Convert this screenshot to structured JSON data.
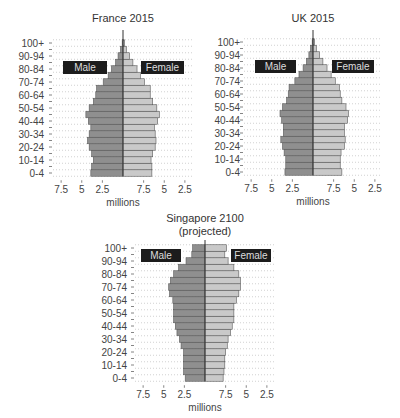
{
  "chart_data": [
    {
      "type": "bar",
      "subtype": "population-pyramid",
      "title": "France 2015",
      "xlabel": "millions",
      "ylabel": "",
      "x_tick_labels_left": [
        "7.5",
        "5",
        "2.5"
      ],
      "x_tick_labels_right": [
        "7.5",
        "5",
        "2.5"
      ],
      "xlim": [
        -7.5,
        7.5
      ],
      "y_tick_labels": [
        "100+",
        "90-94",
        "80-84",
        "70-74",
        "60-64",
        "50-54",
        "40-44",
        "30-34",
        "20-24",
        "10-14",
        "0-4"
      ],
      "legend": [
        "Male",
        "Female"
      ],
      "grid": "dotted horizontal",
      "categories": [
        "0-4",
        "5-9",
        "10-14",
        "15-19",
        "20-24",
        "25-29",
        "30-34",
        "35-39",
        "40-44",
        "45-49",
        "50-54",
        "55-59",
        "60-64",
        "65-69",
        "70-74",
        "75-79",
        "80-84",
        "85-89",
        "90-94",
        "95-99",
        "100+"
      ],
      "series": [
        {
          "name": "Male",
          "values": [
            3.9,
            3.8,
            3.6,
            3.8,
            4.1,
            4.3,
            4.1,
            3.9,
            4.2,
            4.5,
            4.1,
            3.6,
            3.3,
            3.2,
            2.4,
            1.8,
            1.4,
            0.9,
            0.6,
            0.3,
            0.1
          ]
        },
        {
          "name": "Female",
          "values": [
            3.5,
            3.5,
            3.4,
            3.6,
            3.9,
            4.0,
            3.9,
            3.8,
            4.2,
            4.4,
            4.1,
            3.6,
            3.3,
            3.3,
            2.6,
            2.1,
            1.7,
            1.2,
            0.8,
            0.4,
            0.2
          ]
        }
      ]
    },
    {
      "type": "bar",
      "subtype": "population-pyramid",
      "title": "UK 2015",
      "xlabel": "millions",
      "ylabel": "",
      "x_tick_labels_left": [
        "7.5",
        "5",
        "2.5"
      ],
      "x_tick_labels_right": [
        "7.5",
        "5",
        "2.5"
      ],
      "xlim": [
        -7.5,
        7.5
      ],
      "y_tick_labels": [
        "100+",
        "90-94",
        "80-84",
        "70-74",
        "60-64",
        "50-54",
        "40-44",
        "30-34",
        "20-24",
        "10-14",
        "0-4"
      ],
      "legend": [
        "Male",
        "Female"
      ],
      "grid": "dotted horizontal",
      "categories": [
        "0-4",
        "5-9",
        "10-14",
        "15-19",
        "20-24",
        "25-29",
        "30-34",
        "35-39",
        "40-44",
        "45-49",
        "50-54",
        "55-59",
        "60-64",
        "65-69",
        "70-74",
        "75-79",
        "80-84",
        "85-89",
        "90-94",
        "95-99",
        "100+"
      ],
      "series": [
        {
          "name": "Male",
          "values": [
            3.4,
            3.3,
            3.3,
            3.5,
            3.7,
            3.9,
            3.6,
            3.6,
            3.8,
            4.0,
            3.7,
            3.2,
            3.0,
            2.9,
            2.2,
            1.7,
            1.2,
            0.8,
            0.5,
            0.3,
            0.1
          ]
        },
        {
          "name": "Female",
          "values": [
            3.5,
            3.3,
            3.3,
            3.4,
            3.8,
            3.9,
            3.8,
            3.8,
            4.2,
            4.3,
            4.0,
            3.5,
            3.3,
            3.2,
            2.7,
            2.2,
            1.7,
            1.2,
            0.8,
            0.4,
            0.2
          ]
        }
      ]
    },
    {
      "type": "bar",
      "subtype": "population-pyramid",
      "title": "Singapore 2100",
      "subtitle": "(projected)",
      "xlabel": "millions",
      "ylabel": "",
      "x_tick_labels_left": [
        "7.5",
        "5",
        "2.5"
      ],
      "x_tick_labels_right": [
        "7.5",
        "5",
        "2.5"
      ],
      "xlim": [
        -7.5,
        7.5
      ],
      "y_tick_labels": [
        "100+",
        "90-94",
        "80-84",
        "70-74",
        "60-64",
        "50-54",
        "40-44",
        "30-34",
        "20-24",
        "10-14",
        "0-4"
      ],
      "legend": [
        "Male",
        "Female"
      ],
      "grid": "dotted horizontal",
      "categories": [
        "0-4",
        "5-9",
        "10-14",
        "15-19",
        "20-24",
        "25-29",
        "30-34",
        "35-39",
        "40-44",
        "45-49",
        "50-54",
        "55-59",
        "60-64",
        "65-69",
        "70-74",
        "75-79",
        "80-84",
        "85-89",
        "90-94",
        "95-99",
        "100+"
      ],
      "series": [
        {
          "name": "Male",
          "values": [
            2.4,
            2.6,
            2.6,
            2.6,
            2.6,
            2.9,
            3.1,
            3.4,
            3.6,
            3.8,
            3.8,
            3.8,
            3.9,
            4.3,
            4.4,
            4.2,
            3.8,
            3.2,
            2.3,
            1.6,
            1.5
          ]
        },
        {
          "name": "Female",
          "values": [
            2.2,
            2.3,
            2.4,
            2.4,
            2.5,
            2.7,
            2.8,
            3.1,
            3.3,
            3.5,
            3.5,
            3.5,
            3.8,
            4.1,
            4.3,
            4.3,
            4.1,
            3.5,
            2.8,
            2.4,
            2.6
          ]
        }
      ]
    }
  ],
  "style": {
    "male_color": "#8f8f8f",
    "female_color": "#c9c9c9",
    "bar_stroke": "#5a5a5a",
    "badge_color": "#1c1c1c",
    "grid_color": "#bdbdbd",
    "axis_color": "#333333"
  },
  "layout": [
    {
      "x": 0,
      "y": 0,
      "center_x": 123,
      "title_y": 22,
      "axis_top": 30,
      "label_top": 43,
      "male_badge": [
        63,
        61,
        44,
        13
      ],
      "female_badge": [
        141,
        61,
        43,
        13
      ],
      "ylab_x": 44,
      "grid_x0": 53,
      "grid_x1": 193
    },
    {
      "x": 0,
      "y": 0,
      "center_x": 313,
      "title_y": 22,
      "axis_top": 30,
      "label_top": 42,
      "male_badge": [
        255,
        60,
        41,
        13
      ],
      "female_badge": [
        332,
        60,
        42,
        13
      ],
      "ylab_x": 240,
      "grid_x0": 244,
      "grid_x1": 382
    },
    {
      "x": 0,
      "y": 0,
      "center_x": 205,
      "title_y": 222,
      "subtitle_y": 235,
      "axis_top": 240,
      "label_top": 248,
      "male_badge": [
        141,
        249,
        40,
        13
      ],
      "female_badge": [
        231,
        249,
        40,
        13
      ],
      "ylab_x": 127,
      "grid_x0": 135,
      "grid_x1": 276
    }
  ]
}
